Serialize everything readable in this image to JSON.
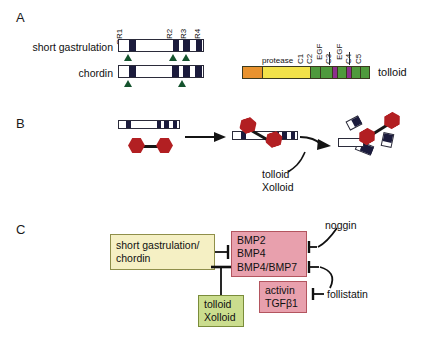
{
  "figure": {
    "panels": [
      {
        "letter": "A"
      },
      {
        "letter": "B"
      },
      {
        "letter": "C"
      }
    ]
  },
  "panel_a": {
    "row_labels": [
      "short gastrulation",
      "chordin"
    ],
    "cr_labels": [
      "CR1",
      "CR2",
      "CR3",
      "CR4"
    ],
    "sog": {
      "cr_blocks": [
        "CR1",
        "CR2",
        "CR3",
        "CR4"
      ],
      "cleavage_markers": 3
    },
    "chordin": {
      "cr_blocks": [
        "CR1",
        "CR2",
        "CR3",
        "CR4"
      ],
      "cleavage_markers": 2
    },
    "tolloid": {
      "name": "tolloid",
      "protease_label": "protease",
      "domains": [
        "C1",
        "C2",
        "EGF",
        "C3",
        "EGF",
        "C4",
        "C5"
      ],
      "colors": {
        "prodomain": "#e8922e",
        "protease": "#f2e24a",
        "cub": "#4f9a3c",
        "egf": "#8d2f8d"
      }
    }
  },
  "panel_b": {
    "caption": [
      "tolloid",
      "Xolloid"
    ],
    "bmp_color": "#b21f22",
    "cr_color": "#1b1b3c"
  },
  "panel_c": {
    "boxes": {
      "chordin": {
        "lines": [
          "short gastrulation/",
          "chordin"
        ],
        "color": "#f5f0c4"
      },
      "bmp": {
        "lines": [
          "BMP2",
          "BMP4",
          "BMP4/BMP7"
        ],
        "color": "#e8a0ad"
      },
      "activin": {
        "lines": [
          "activin",
          "TGFβ1"
        ],
        "color": "#e8a0ad"
      },
      "tolloid": {
        "lines": [
          "tolloid",
          "Xolloid"
        ],
        "color": "#cbdd8e"
      }
    },
    "labels": {
      "noggin": "noggin",
      "follistatin": "follistatin"
    }
  }
}
